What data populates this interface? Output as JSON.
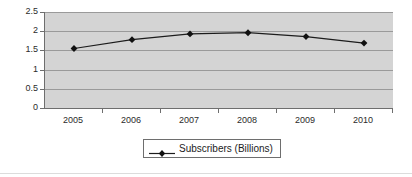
{
  "chart_data": {
    "type": "line",
    "title": "",
    "xlabel": "",
    "ylabel": "",
    "categories": [
      "2005",
      "2006",
      "2007",
      "2008",
      "2009",
      "2010"
    ],
    "series": [
      {
        "name": "Subscribers (Billions)",
        "values": [
          1.55,
          1.78,
          1.93,
          1.96,
          1.86,
          1.69
        ]
      }
    ],
    "ylim": [
      0,
      2.5
    ],
    "yticks": [
      "0",
      "0.5",
      "1",
      "1.5",
      "2",
      "2.5"
    ],
    "ytick_values": [
      0,
      0.5,
      1,
      1.5,
      2,
      2.5
    ],
    "grid": true,
    "grid_axis": "y",
    "legend": {
      "position": "bottom",
      "entries": [
        {
          "label": "Subscribers (Billions)",
          "marker": "diamond"
        }
      ]
    },
    "colors": {
      "plot_background": "#d4d4d4",
      "gridline": "#9a9a9a",
      "axis": "#6e6e6e",
      "series_line": "#1c1c1c",
      "marker": "#111111",
      "text": "#2b2b2b",
      "chart_background": "#ffffff"
    }
  }
}
